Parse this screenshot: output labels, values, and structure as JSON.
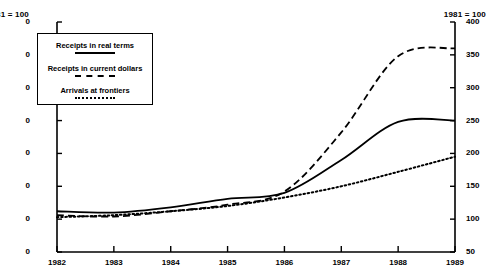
{
  "chart_data": {
    "type": "line",
    "title": "",
    "xlabel": "",
    "ylabel": "",
    "left_axis_header": "1981 = 100",
    "right_axis_header": "1981 = 100",
    "left_axis_header_clipped": "81 = 100",
    "categories": [
      "1982",
      "1983",
      "1984",
      "1985",
      "1986",
      "1987",
      "1988",
      "1989"
    ],
    "ylim": [
      50,
      400
    ],
    "yticks": [
      50,
      100,
      150,
      200,
      250,
      300,
      350,
      400
    ],
    "ytick_labels_left": [
      "0",
      "0",
      "0",
      "0",
      "0",
      "0",
      "0",
      "0"
    ],
    "ytick_labels_right": [
      "50",
      "100",
      "150",
      "200",
      "250",
      "300",
      "350",
      "400"
    ],
    "grid": false,
    "legend_position": "top-left",
    "series": [
      {
        "name": "Receipts in real terms",
        "style": "solid",
        "values": [
          112,
          110,
          118,
          131,
          140,
          190,
          248,
          250
        ]
      },
      {
        "name": "Receipts in current dollars",
        "style": "dashed",
        "values": [
          106,
          104,
          112,
          122,
          142,
          232,
          348,
          360
        ]
      },
      {
        "name": "Arrivals at frontiers",
        "style": "dotted",
        "values": [
          103,
          106,
          112,
          120,
          133,
          150,
          172,
          195
        ]
      }
    ]
  },
  "legend": {
    "entries": [
      {
        "label": "Receipts in real terms",
        "style": "solid"
      },
      {
        "label": "Receipts in current dollars",
        "style": "dashed"
      },
      {
        "label": "Arrivals at frontiers",
        "style": "dotted"
      }
    ]
  },
  "colors": {
    "line": "#000000",
    "axis": "#000000",
    "background": "#ffffff"
  }
}
